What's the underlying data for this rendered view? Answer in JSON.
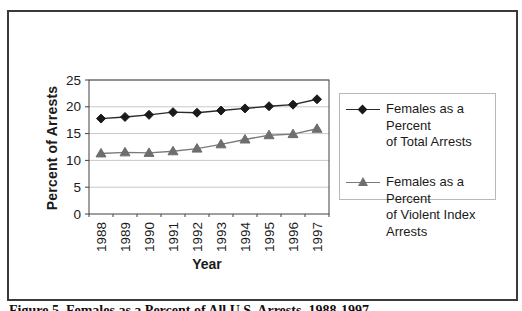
{
  "figure": {
    "caption": "Figure 5. Females as a Percent of All U.S. Arrests, 1988-1997"
  },
  "chart_data": {
    "type": "line",
    "title": "",
    "xlabel": "Year",
    "ylabel": "Percent of Arrests",
    "categories": [
      "1988",
      "1989",
      "1990",
      "1991",
      "1992",
      "1993",
      "1994",
      "1995",
      "1996",
      "1997"
    ],
    "series": [
      {
        "name": "Females as a Percent of Total Arrests",
        "marker": "diamond",
        "color": "#1a1a1a",
        "line_color": "#2a2a2a",
        "values": [
          17.8,
          18.1,
          18.5,
          19.0,
          18.9,
          19.3,
          19.7,
          20.1,
          20.4,
          21.4
        ]
      },
      {
        "name": "Females as a Percent of Violent Index Arrests",
        "marker": "triangle",
        "color": "#6e6e6e",
        "line_color": "#7a7a7a",
        "values": [
          11.3,
          11.5,
          11.4,
          11.7,
          12.2,
          13.0,
          13.9,
          14.7,
          14.9,
          15.9
        ]
      }
    ],
    "ylim": [
      0,
      25
    ],
    "ytick_step": 5,
    "grid": true,
    "legend_position": "right"
  },
  "legend": {
    "items": [
      {
        "lines": [
          "Females as a Percent",
          "of Total Arrests",
          ""
        ]
      },
      {
        "lines": [
          "Females as a Percent",
          "of Violent Index",
          "Arrests"
        ]
      }
    ]
  },
  "colors": {
    "gridline": "#c9c9c9",
    "axis_border": "#404040",
    "tick_label": "#1a1a1a",
    "legend_border": "#b8b8b8",
    "frame_border": "#3a3a3a",
    "background": "#ffffff"
  }
}
